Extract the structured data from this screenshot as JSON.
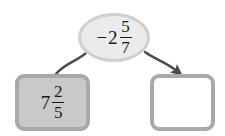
{
  "diagram": {
    "type": "arrow-flow",
    "background_color": "#ffffff",
    "nodes": [
      {
        "id": "source-ellipse",
        "shape": "ellipse",
        "role": "operand",
        "fill_color": "#ebebeb",
        "border_color": "#cfcfcf",
        "text": "-2 5/7",
        "expression": {
          "sign": "−",
          "whole": "2",
          "numerator": "5",
          "denominator": "7"
        }
      },
      {
        "id": "left-box",
        "shape": "rounded-rectangle",
        "role": "operand",
        "fill_color": "#c9c9c9",
        "border_color": "#a9a9a9",
        "text": "7 2/5",
        "expression": {
          "sign": "",
          "whole": "7",
          "numerator": "2",
          "denominator": "5"
        }
      },
      {
        "id": "right-box",
        "shape": "rounded-rectangle",
        "role": "answer-blank",
        "fill_color": "#ffffff",
        "border_color": "#a9a9a9",
        "text": ""
      }
    ],
    "connectors": [
      {
        "id": "ellipse-to-left-box",
        "from": "source-ellipse",
        "to": "left-box",
        "style": "curved-line",
        "arrowhead": false,
        "color": "#4a4a4a"
      },
      {
        "id": "ellipse-to-right-box",
        "from": "source-ellipse",
        "to": "right-box",
        "style": "curved-arrow",
        "arrowhead": true,
        "color": "#4a4a4a"
      }
    ]
  }
}
